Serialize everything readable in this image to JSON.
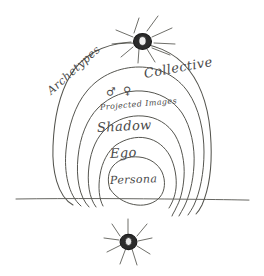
{
  "diagram": {
    "style": "hand-drawn pencil sketch on white paper",
    "background_color": "#ffffff",
    "ink_color": "#4a4a4a",
    "labels": {
      "archetypes": "Archetypes",
      "collective": "Collective",
      "animus_anima": "♂ ♀",
      "projected_images": "Projected Images",
      "shadow": "Shadow",
      "ego": "Ego",
      "persona": "Persona"
    },
    "layers": [
      {
        "name": "Archetypes / Collective",
        "order": 1,
        "position": "outermost"
      },
      {
        "name": "Animus / Anima",
        "order": 2,
        "position": "second"
      },
      {
        "name": "Projected Images",
        "order": 3,
        "position": "third"
      },
      {
        "name": "Shadow",
        "order": 4,
        "position": "fourth"
      },
      {
        "name": "Ego",
        "order": 5,
        "position": "fifth"
      },
      {
        "name": "Persona",
        "order": 6,
        "position": "innermost"
      }
    ],
    "marks": {
      "top_star": "star-burst",
      "bottom_star": "star-burst",
      "baseline": "horizontal-line"
    }
  }
}
